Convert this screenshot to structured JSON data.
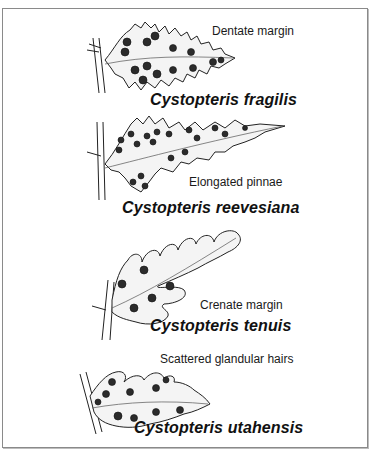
{
  "figure": {
    "panels": [
      {
        "id": "fragilis",
        "feature_label": "Dentate margin",
        "species_name": "Cystopteris fragilis",
        "illustration": "fern-pinna-dentate"
      },
      {
        "id": "reevesiana",
        "feature_label": "Elongated pinnae",
        "species_name": "Cystopteris reevesiana",
        "illustration": "fern-pinna-elongated"
      },
      {
        "id": "tenuis",
        "feature_label": "Crenate margin",
        "species_name": "Cystopteris tenuis",
        "illustration": "fern-pinna-crenate"
      },
      {
        "id": "utahensis",
        "feature_label": "Scattered glandular hairs",
        "species_name": "Cystopteris utahensis",
        "illustration": "fern-pinna-glandular"
      }
    ],
    "colors": {
      "border": "#8a8a8a",
      "ink": "#111111",
      "background": "#ffffff"
    }
  }
}
